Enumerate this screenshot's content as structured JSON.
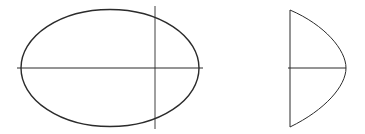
{
  "diagram": {
    "stroke_color": "#2b2b2b",
    "background": "#ffffff",
    "front_view": {
      "shape": "ellipse",
      "center": [
        110,
        68
      ],
      "rx": 89,
      "ry": 58.5,
      "horizontal_axis": {
        "x1": 17,
        "y1": 68,
        "x2": 203,
        "y2": 68
      },
      "vertical_line": {
        "x1": 155,
        "y1": 6,
        "x2": 155,
        "y2": 129
      }
    },
    "side_view": {
      "shape": "half-ellipse-section",
      "vertical_line": {
        "x1": 290,
        "y1": 10,
        "x2": 290,
        "y2": 127
      },
      "horizontal_axis": {
        "x1": 288,
        "y1": 68,
        "x2": 346,
        "y2": 68
      },
      "curve_apex": [
        346,
        68
      ]
    }
  }
}
